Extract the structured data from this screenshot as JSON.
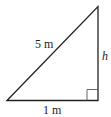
{
  "diagram": {
    "type": "right-triangle",
    "labels": {
      "hypotenuse": "5 m",
      "base": "1 m",
      "height": "h"
    },
    "colors": {
      "stroke": "#222222",
      "angle_marker": "#555555",
      "background": "#ffffff"
    }
  }
}
